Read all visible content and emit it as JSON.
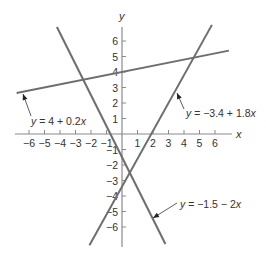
{
  "chart_data": {
    "type": "line",
    "title": "",
    "xlabel": "x",
    "ylabel": "y",
    "xlim": [
      -6.8,
      7
    ],
    "ylim": [
      -7.2,
      7.2
    ],
    "grid": false,
    "x_ticks": [
      -6,
      -5,
      -4,
      -3,
      -2,
      -1,
      1,
      2,
      3,
      4,
      5,
      6
    ],
    "y_ticks": [
      -6,
      -5,
      -4,
      -3,
      -2,
      -1,
      1,
      2,
      3,
      4,
      5,
      6
    ],
    "x_tick_labels": [
      "−6",
      "−5",
      "−4",
      "−3",
      "−2",
      "−1",
      "1",
      "2",
      "3",
      "4",
      "5",
      "6"
    ],
    "y_tick_labels": [
      "−6",
      "−5",
      "−4",
      "−3",
      "−2",
      "−1",
      "1",
      "2",
      "3",
      "4",
      "5",
      "6"
    ],
    "series": [
      {
        "name": "y = 4 + 0.2x",
        "intercept": 4,
        "slope": 0.2,
        "x_range": [
          -6.8,
          6.9
        ],
        "points": [
          [
            -6.8,
            2.64
          ],
          [
            6.9,
            5.38
          ]
        ]
      },
      {
        "name": "y = −1.5 − 2x",
        "intercept": -1.5,
        "slope": -2,
        "x_range": [
          -4.2,
          2.8
        ],
        "points": [
          [
            -4.2,
            6.9
          ],
          [
            2.8,
            -7.1
          ]
        ]
      },
      {
        "name": "y = −3.4 + 1.8x",
        "intercept": -3.4,
        "slope": 1.8,
        "x_range": [
          -2.1,
          5.8
        ],
        "points": [
          [
            -2.1,
            -7.18
          ],
          [
            5.8,
            7.04
          ]
        ]
      }
    ],
    "annotations": [
      {
        "text": "y = 4 + 0.2x",
        "points_to_series": 0
      },
      {
        "text": "y = −3.4 + 1.8x",
        "points_to_series": 2
      },
      {
        "text": "y = −1.5 − 2x",
        "points_to_series": 1
      }
    ]
  },
  "axes": {
    "x_label": "x",
    "y_label": "y"
  },
  "labels": {
    "line1": {
      "y": "y",
      "rest": " = 4 + 0.2",
      "x": "x"
    },
    "line2": {
      "y": "y",
      "rest": " = −1.5 − 2",
      "x": "x"
    },
    "line3": {
      "y": "y",
      "rest": " = −3.4 + 1.8",
      "x": "x"
    }
  },
  "colors": {
    "line": "#6e6e6e",
    "axis": "#8a8a8a",
    "text": "#333333"
  }
}
